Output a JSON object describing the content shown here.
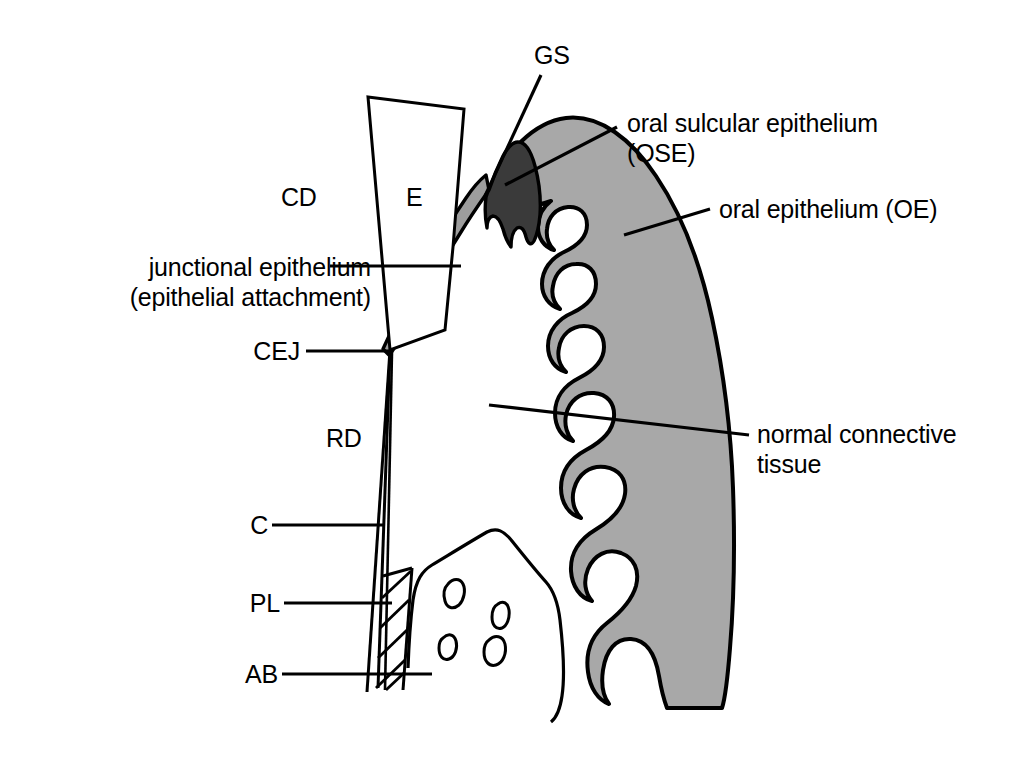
{
  "figure": {
    "background_color": "#ffffff",
    "line_color": "#000000",
    "colors": {
      "connective_tissue_gray": "#a8a8a8",
      "sulcular_epithelium_dark": "#3a3a3a",
      "junctional_epithelium_gray": "#9d9d9d",
      "enamel_white": "#ffffff",
      "outline": "#000000"
    }
  },
  "labels": {
    "gs": "GS",
    "cd": "CD",
    "e": "E",
    "rd": "RD",
    "c": "C",
    "pl": "PL",
    "ab": "AB",
    "cej": "CEJ",
    "junctional_epithelium_line1": "junctional epithelium",
    "junctional_epithelium_line2": "(epithelial attachment)",
    "oral_sulcular_line1": "oral sulcular epithelium",
    "oral_sulcular_line2": "(OSE)",
    "oral_epithelium": "oral epithelium (OE)",
    "normal_connective_line1": "normal connective",
    "normal_connective_line2": "tissue"
  },
  "structures": [
    {
      "key": "gs",
      "abbr": "GS",
      "name": "GS"
    },
    {
      "key": "cd",
      "abbr": "CD",
      "name": "CD"
    },
    {
      "key": "e",
      "abbr": "E",
      "name": "E"
    },
    {
      "key": "rd",
      "abbr": "RD",
      "name": "RD"
    },
    {
      "key": "c",
      "abbr": "C",
      "name": "C"
    },
    {
      "key": "pl",
      "abbr": "PL",
      "name": "PL"
    },
    {
      "key": "ab",
      "abbr": "AB",
      "name": "AB"
    },
    {
      "key": "cej",
      "abbr": "CEJ",
      "name": "CEJ"
    }
  ]
}
